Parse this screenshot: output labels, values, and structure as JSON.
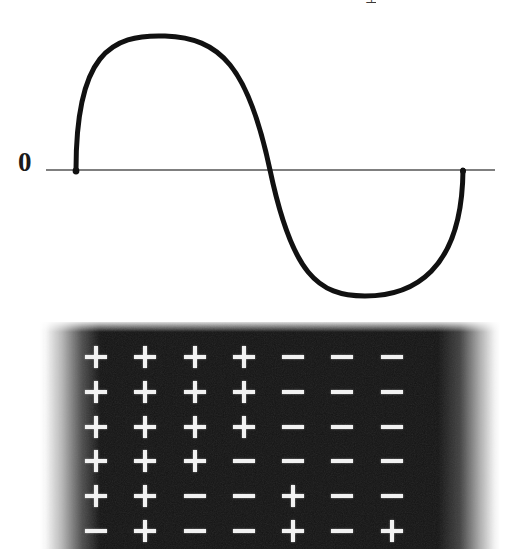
{
  "figure": {
    "background_color": "#ffffff",
    "panels": [
      "wave-panel",
      "charge-panel"
    ]
  },
  "wave": {
    "axis_label": "0",
    "top_cropped_glyph": "⊥",
    "line_color": "#111111",
    "axis_color": "#555555",
    "axis_y": 170,
    "axis_x_start": 46,
    "axis_x_end": 495,
    "stroke_width": 5,
    "path": "M 76 170 C 76 55, 110 34, 165 36 C 220 38, 248 66, 270 170 C 292 274, 318 296, 365 296 C 412 296, 462 272, 463 170"
  },
  "chart_data": {
    "type": "line",
    "title": "",
    "subtitle": "",
    "xlabel": "",
    "ylabel": "",
    "grid": false,
    "legend": null,
    "annotations": [
      {
        "text": "0",
        "x": 0,
        "y": 0,
        "role": "zero-axis-label"
      }
    ],
    "yticks": [
      0
    ],
    "ytick_labels": [
      "0"
    ],
    "xticks": [],
    "xtick_labels": [],
    "xlim": [
      0,
      1
    ],
    "ylim": [
      -1.0,
      1.0
    ],
    "series": [
      {
        "name": "wave",
        "description": "one full cycle of a sine wave: positive half-cycle then negative half-cycle",
        "x": [
          0.0,
          0.05,
          0.1,
          0.15,
          0.2,
          0.23,
          0.25,
          0.3,
          0.35,
          0.4,
          0.45,
          0.5,
          0.55,
          0.6,
          0.65,
          0.7,
          0.75,
          0.8,
          0.85,
          0.9,
          0.95,
          1.0
        ],
        "y": [
          0.0,
          0.53,
          0.83,
          0.96,
          1.0,
          1.0,
          0.99,
          0.92,
          0.78,
          0.56,
          0.29,
          0.0,
          -0.29,
          -0.56,
          -0.78,
          -0.92,
          -1.0,
          -0.99,
          -0.92,
          -0.72,
          -0.42,
          0.0
        ],
        "zero_crossings": [
          0.0,
          0.5,
          1.0
        ],
        "peak": {
          "x": 0.21,
          "y": 1.0
        },
        "trough": {
          "x": 0.74,
          "y": -1.0
        }
      }
    ]
  },
  "charge_grid": {
    "panel_background_color": "#141414",
    "symbol_color": "#f2f2f2",
    "columns": 7,
    "rows": 6,
    "plus_symbol": "+",
    "minus_symbol": "−",
    "cells": [
      [
        "+",
        "+",
        "+",
        "+",
        "-",
        "-",
        "-"
      ],
      [
        "+",
        "+",
        "+",
        "+",
        "-",
        "-",
        "-"
      ],
      [
        "+",
        "+",
        "+",
        "+",
        "-",
        "-",
        "-"
      ],
      [
        "+",
        "+",
        "+",
        "-",
        "-",
        "-",
        "-"
      ],
      [
        "+",
        "+",
        "-",
        "-",
        "+",
        "-",
        "-"
      ],
      [
        "-",
        "+",
        "-",
        "-",
        "+",
        "-",
        "+"
      ]
    ],
    "plus_count": 25,
    "minus_count": 17
  }
}
